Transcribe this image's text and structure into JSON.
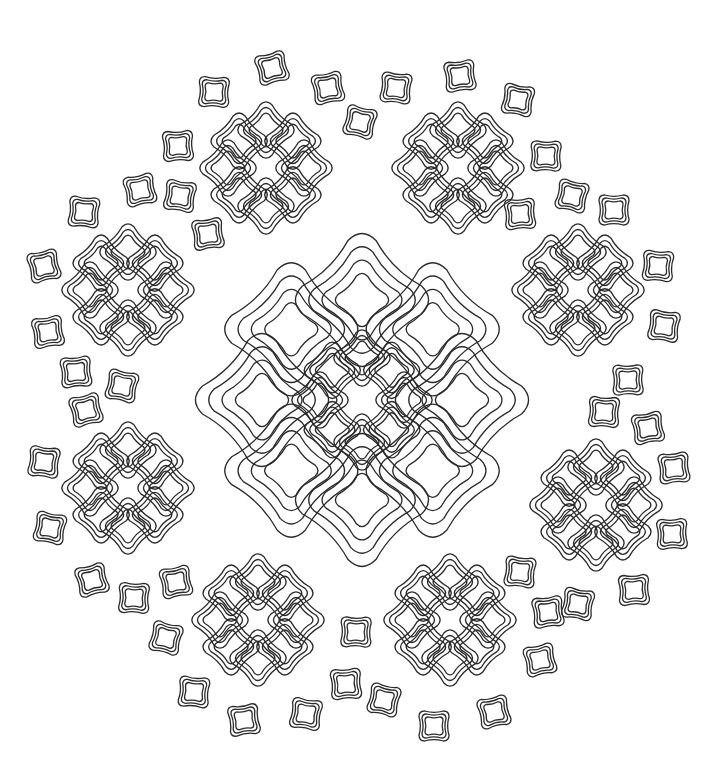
{
  "image": {
    "kind": "mandala line art",
    "background": "#ffffff",
    "stroke": "#2a2a2a",
    "width": 724,
    "height": 783
  },
  "center": {
    "x": 362,
    "y": 400
  },
  "center_flower": {
    "petal_count": 8,
    "radius": 42,
    "petal_size": 22,
    "outlines": 3
  },
  "large_ring": {
    "petal_count": 8,
    "radius": 100,
    "petal_size": 52,
    "outlines": 4,
    "offset_deg": 0
  },
  "flowers": [
    {
      "x": 266,
      "y": 168
    },
    {
      "x": 458,
      "y": 168
    },
    {
      "x": 128,
      "y": 290
    },
    {
      "x": 578,
      "y": 290
    },
    {
      "x": 128,
      "y": 488
    },
    {
      "x": 596,
      "y": 505
    },
    {
      "x": 258,
      "y": 620
    },
    {
      "x": 450,
      "y": 620
    }
  ],
  "flower_style": {
    "petal_count": 8,
    "radius": 38,
    "petal_size": 22,
    "outlines": 3
  },
  "small_squares": [
    [
      272,
      68
    ],
    [
      214,
      92
    ],
    [
      328,
      88
    ],
    [
      396,
      88
    ],
    [
      460,
      76
    ],
    [
      518,
      100
    ],
    [
      178,
      146
    ],
    [
      360,
      122
    ],
    [
      546,
      156
    ],
    [
      140,
      190
    ],
    [
      84,
      212
    ],
    [
      208,
      234
    ],
    [
      180,
      196
    ],
    [
      520,
      214
    ],
    [
      572,
      196
    ],
    [
      614,
      210
    ],
    [
      44,
      266
    ],
    [
      658,
      266
    ],
    [
      48,
      332
    ],
    [
      664,
      326
    ],
    [
      76,
      372
    ],
    [
      122,
      386
    ],
    [
      628,
      380
    ],
    [
      86,
      410
    ],
    [
      604,
      412
    ],
    [
      648,
      428
    ],
    [
      44,
      462
    ],
    [
      674,
      468
    ],
    [
      50,
      528
    ],
    [
      672,
      534
    ],
    [
      92,
      580
    ],
    [
      134,
      598
    ],
    [
      176,
      582
    ],
    [
      520,
      572
    ],
    [
      548,
      612
    ],
    [
      578,
      604
    ],
    [
      634,
      590
    ],
    [
      166,
      638
    ],
    [
      356,
      632
    ],
    [
      540,
      660
    ],
    [
      194,
      692
    ],
    [
      244,
      720
    ],
    [
      306,
      714
    ],
    [
      346,
      684
    ],
    [
      384,
      700
    ],
    [
      434,
      726
    ],
    [
      494,
      712
    ]
  ],
  "small_square_style": {
    "size": 15,
    "outlines": 3
  }
}
